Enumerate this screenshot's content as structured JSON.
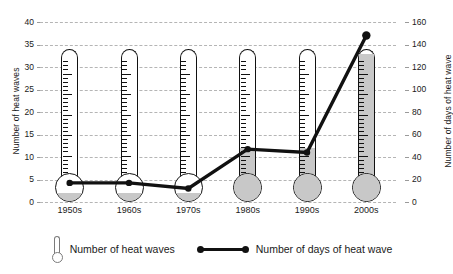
{
  "chart_data": {
    "type": "bar",
    "title": "",
    "subtitle": "",
    "xlabel": "",
    "categories": [
      "1950s",
      "1960s",
      "1970s",
      "1980s",
      "1990s",
      "2000s"
    ],
    "grid": true,
    "legend_position": "bottom",
    "axes": {
      "left": {
        "label": "Number of heat waves",
        "min": 0,
        "max": 40,
        "step": 5,
        "ticks": [
          "0",
          "5",
          "10",
          "15",
          "20",
          "25",
          "30",
          "35",
          "40"
        ]
      },
      "right": {
        "label": "Number of days of heat wave",
        "min": 0,
        "max": 160,
        "step": 20,
        "ticks": [
          "0",
          "20",
          "40",
          "60",
          "80",
          "100",
          "120",
          "140",
          "160"
        ]
      }
    },
    "series": [
      {
        "name": "Number of heat waves",
        "axis": "left",
        "render": "thermometer",
        "values": [
          2,
          2,
          2,
          12,
          12,
          33
        ]
      },
      {
        "name": "Number of days of heat wave",
        "axis": "right",
        "render": "line",
        "values": [
          17,
          17,
          12,
          47,
          44,
          148
        ]
      }
    ]
  },
  "legend": {
    "items": [
      {
        "label": "Number of heat waves",
        "marker": "thermometer-glyph"
      },
      {
        "label": "Number of days of heat wave",
        "marker": "line-with-dots-glyph"
      }
    ]
  },
  "colors": {
    "fill": "#c8c8c8",
    "outline": "#111111",
    "grid": "#b5b5b5",
    "line": "#111111",
    "text": "#1a1a1a",
    "background": "#ffffff"
  }
}
